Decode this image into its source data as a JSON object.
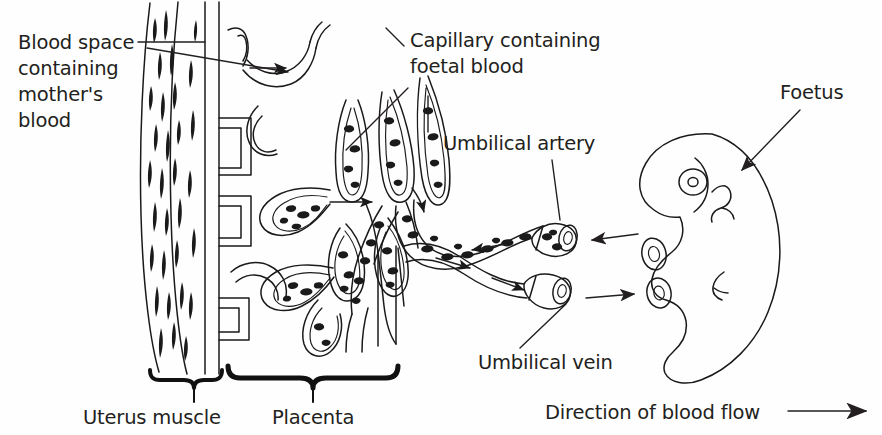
{
  "figure": {
    "background_color": "#fefefe",
    "ink_color": "#1a1a1a",
    "text_color": "#231f20"
  },
  "labels": {
    "blood_space": {
      "line1": "Blood space",
      "line2": "containing",
      "line3": "mother's",
      "line4": "blood"
    },
    "capillary": {
      "line1": "Capillary containing",
      "line2": "foetal blood"
    },
    "umbilical_artery": "Umbilical artery",
    "umbilical_vein": "Umbilical vein",
    "foetus": "Foetus",
    "uterus_muscle": "Uterus muscle",
    "placenta": "Placenta",
    "blood_flow": "Direction of blood flow"
  },
  "structures": {
    "uterus_wall": "uterus-muscle-wall",
    "villi": "placental-villi",
    "cord": "umbilical-cord",
    "foetus_body": "foetus-outline",
    "artery_opening": "umbilical-artery-cut-end",
    "vein_opening": "umbilical-vein-cut-end",
    "eye": "foetus-eye",
    "arm_bud": "foetus-arm-bud",
    "leg_bud": "foetus-leg-bud"
  },
  "flow_arrows": {
    "maternal_in": "maternal-blood-inflow-arrow",
    "villus_space": "intervillous-space-arrow",
    "cord_to_placenta": "artery-flow-toward-placenta",
    "cord_to_foetus": "vein-flow-toward-foetus",
    "artery_from_foetus": "artery-arrow-pointing-left",
    "vein_to_foetus": "vein-arrow-pointing-right",
    "legend_arrow": "blood-flow-legend-arrow"
  }
}
